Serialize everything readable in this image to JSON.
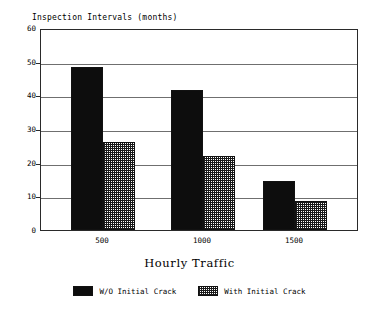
{
  "chart_data": {
    "type": "bar",
    "title": "",
    "ylabel": "Inspection Intervals (months)",
    "xlabel": "Hourly Traffic",
    "categories": [
      "500",
      "1000",
      "1500"
    ],
    "series": [
      {
        "name": "W/O Initial Crack",
        "values": [
          48.5,
          41.5,
          14.5
        ],
        "fill": "solid"
      },
      {
        "name": "With Initial Crack",
        "values": [
          26.0,
          22.0,
          8.5
        ],
        "fill": "hatch"
      }
    ],
    "ylim": [
      0,
      60
    ],
    "yticks": [
      0,
      10,
      20,
      30,
      40,
      50,
      60
    ],
    "ytick_labels": [
      "0",
      "10",
      "20",
      "30",
      "40",
      "50",
      "60"
    ],
    "grid": true,
    "legend_position": "bottom",
    "colors": {
      "solid": "#0d0d0d",
      "hatch_line": "#1a1a1a",
      "hatch_background": "#ffffff",
      "axis": "#2a2a2a",
      "gridline": "#6f6f6f",
      "background": "#ffffff"
    }
  },
  "legend": {
    "items": [
      {
        "label": "W/O Initial Crack",
        "fill": "solid"
      },
      {
        "label": "With Initial Crack",
        "fill": "hatch"
      }
    ]
  }
}
